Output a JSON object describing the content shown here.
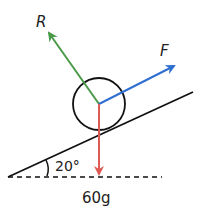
{
  "diagram": {
    "labels": {
      "normal_reaction": "R",
      "applied_force": "F",
      "angle": "20°",
      "weight": "60g"
    },
    "colors": {
      "normal_reaction": "#4a9a4a",
      "applied_force": "#2f6fd1",
      "weight": "#e05a55",
      "line": "#111111"
    }
  }
}
